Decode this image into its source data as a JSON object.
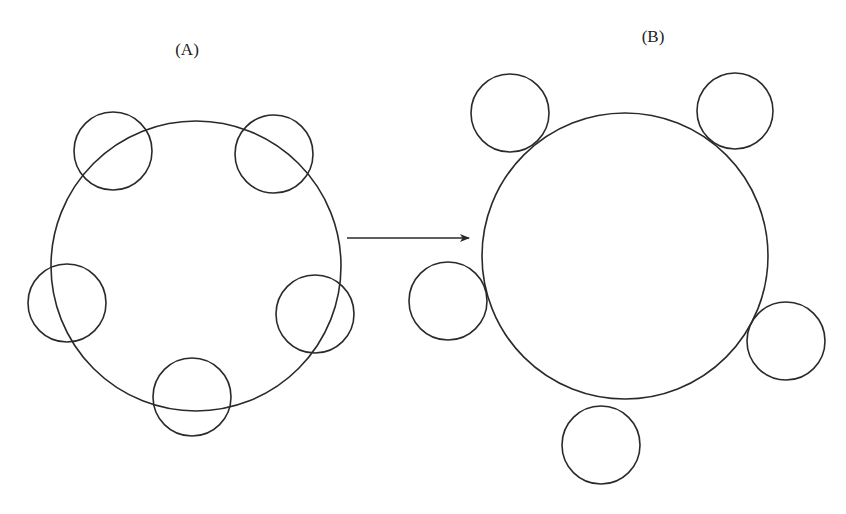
{
  "labels": {
    "panel_a": "(A)",
    "panel_b": "(B)"
  },
  "style": {
    "stroke": "#2a2a2a",
    "stroke_width": 1.6,
    "background": "#ffffff"
  },
  "panels": [
    {
      "id": "A",
      "label_pos": [
        187,
        50
      ],
      "large_circle": {
        "cx": 196,
        "cy": 266,
        "r": 145
      },
      "small_circles": [
        {
          "name": "top-left",
          "cx": 113,
          "cy": 151,
          "r": 39
        },
        {
          "name": "top-right",
          "cx": 274,
          "cy": 154,
          "r": 39
        },
        {
          "name": "left",
          "cx": 67,
          "cy": 303,
          "r": 39
        },
        {
          "name": "right",
          "cx": 315,
          "cy": 314,
          "r": 39
        },
        {
          "name": "bottom",
          "cx": 192,
          "cy": 397,
          "r": 39
        }
      ],
      "relationship": "small circles overlap the large circle's boundary"
    },
    {
      "id": "B",
      "label_pos": [
        653,
        37
      ],
      "large_circle": {
        "cx": 625,
        "cy": 256,
        "r": 143
      },
      "small_circles": [
        {
          "name": "top-left",
          "cx": 510,
          "cy": 113,
          "r": 39
        },
        {
          "name": "top-right",
          "cx": 735,
          "cy": 111,
          "r": 38
        },
        {
          "name": "left",
          "cx": 448,
          "cy": 301,
          "r": 39
        },
        {
          "name": "right",
          "cx": 786,
          "cy": 341,
          "r": 39
        },
        {
          "name": "bottom",
          "cx": 601,
          "cy": 445,
          "r": 39
        }
      ],
      "relationship": "small circles lie outside, touching or detached from the large circle"
    }
  ],
  "arrow": {
    "x1": 347,
    "y1": 238,
    "x2": 469,
    "y2": 238,
    "direction": "A to B"
  }
}
